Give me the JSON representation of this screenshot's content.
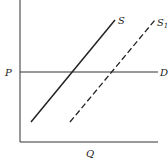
{
  "diagram": {
    "axes": {
      "y_label": "P",
      "x_label": "Q"
    },
    "lines": {
      "demand": {
        "label": "D",
        "style": "solid"
      },
      "supply": {
        "label": "S",
        "style": "solid"
      },
      "supply_shifted": {
        "label": "S",
        "subscript": "1",
        "style": "dashed"
      }
    },
    "colors": {
      "line": "#222222",
      "background": "#ffffff"
    }
  }
}
